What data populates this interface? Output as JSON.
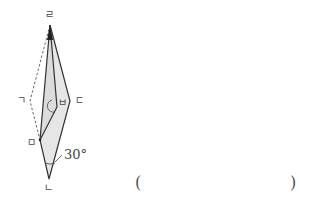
{
  "figure": {
    "vertices": {
      "top": {
        "label": "ㄹ",
        "x": 50,
        "y": 25
      },
      "left": {
        "label": "ㄱ",
        "x": 30,
        "y": 101
      },
      "right": {
        "label": "ㄷ",
        "x": 70,
        "y": 101
      },
      "inner": {
        "label": "ㅂ",
        "x": 57,
        "y": 107
      },
      "fold": {
        "label": "ㅁ",
        "x": 40,
        "y": 140
      },
      "bottom": {
        "label": "ㄴ",
        "x": 49,
        "y": 179
      }
    },
    "angle_label": "30°",
    "colors": {
      "fill": "#e6e6e6",
      "stroke": "#333333",
      "dashed": "#555555"
    }
  },
  "answer": {
    "open_paren": "(",
    "close_paren": ")"
  }
}
